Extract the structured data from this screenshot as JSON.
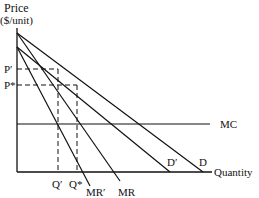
{
  "diagram": {
    "type": "economics-monopoly-demand-shift",
    "axes": {
      "y_label_line1": "Price",
      "y_label_line2": "($/unit)",
      "x_label": "Quantity"
    },
    "curves": {
      "mc": "MC",
      "demand": "D",
      "demand_prime": "D′",
      "mr": "MR",
      "mr_prime": "MR′"
    },
    "price_ticks": {
      "p_prime": "P′",
      "p_star": "P*"
    },
    "quantity_ticks": {
      "q_prime": "Q′",
      "q_star": "Q*"
    },
    "colors": {
      "line": "#111111",
      "background": "#ffffff"
    }
  }
}
